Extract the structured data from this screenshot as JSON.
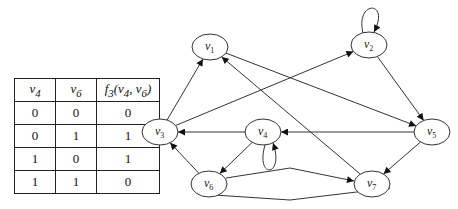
{
  "truth_table": {
    "headers": [
      "v4",
      "v6",
      "f3(v4, v6)"
    ],
    "header_parts": [
      {
        "main": "v",
        "sub": "4"
      },
      {
        "main": "v",
        "sub": "6"
      },
      {
        "main": "f",
        "sub": "3",
        "rest": "(v",
        "sub2": "4",
        "rest2": ", v",
        "sub3": "6",
        "rest3": ")"
      }
    ],
    "rows": [
      [
        "0",
        "0",
        "0"
      ],
      [
        "0",
        "1",
        "1"
      ],
      [
        "1",
        "0",
        "1"
      ],
      [
        "1",
        "1",
        "0"
      ]
    ]
  },
  "graph": {
    "nodes": [
      {
        "id": "v1",
        "main": "v",
        "sub": "1",
        "x": 210,
        "y": 47
      },
      {
        "id": "v2",
        "main": "v",
        "sub": "2",
        "x": 369,
        "y": 45
      },
      {
        "id": "v3",
        "main": "v",
        "sub": "3",
        "x": 160,
        "y": 132
      },
      {
        "id": "v4",
        "main": "v",
        "sub": "4",
        "x": 263,
        "y": 132
      },
      {
        "id": "v5",
        "main": "v",
        "sub": "5",
        "x": 432,
        "y": 132
      },
      {
        "id": "v6",
        "main": "v",
        "sub": "6",
        "x": 209,
        "y": 184
      },
      {
        "id": "v7",
        "main": "v",
        "sub": "7",
        "x": 372,
        "y": 184
      }
    ],
    "edges": [
      {
        "from": "v1",
        "to": "v5"
      },
      {
        "from": "v3",
        "to": "v1"
      },
      {
        "from": "v3",
        "to": "v2"
      },
      {
        "from": "v7",
        "to": "v1"
      },
      {
        "from": "v2",
        "to": "v2"
      },
      {
        "from": "v2",
        "to": "v5"
      },
      {
        "from": "v5",
        "to": "v4"
      },
      {
        "from": "v5",
        "to": "v7"
      },
      {
        "from": "v4",
        "to": "v3"
      },
      {
        "from": "v4",
        "to": "v6"
      },
      {
        "from": "v4",
        "to": "v4"
      },
      {
        "from": "v6",
        "to": "v3"
      },
      {
        "from": "v6",
        "to": "v7"
      },
      {
        "from": "v7",
        "to": "v6"
      }
    ]
  }
}
